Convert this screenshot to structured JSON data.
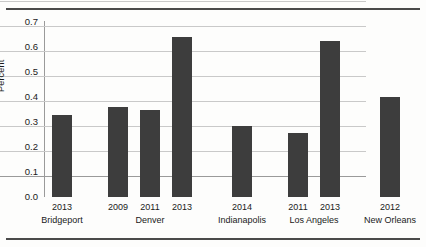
{
  "chart_data": {
    "type": "bar",
    "title": "",
    "xlabel": "",
    "ylabel": "Percent",
    "ylim": [
      0.0,
      0.75
    ],
    "yticks": [
      "0.0",
      "0.1",
      "0.2",
      "0.3",
      "0.4",
      "0.5",
      "0.6",
      "0.7"
    ],
    "ytick_values": [
      0.0,
      0.1,
      0.2,
      0.3,
      0.4,
      0.5,
      0.6,
      0.7
    ],
    "grid": "horizontal",
    "legend": "none",
    "categories": [
      "2013",
      "2009",
      "2011",
      "2013",
      "2014",
      "2011",
      "2013",
      "2012"
    ],
    "groups": [
      {
        "name": "Bridgeport",
        "years": [
          "2013"
        ]
      },
      {
        "name": "Denver",
        "years": [
          "2009",
          "2011",
          "2013"
        ]
      },
      {
        "name": "Indianapolis",
        "years": [
          "2014"
        ]
      },
      {
        "name": "Los Angeles",
        "years": [
          "2011",
          "2013"
        ]
      },
      {
        "name": "New Orleans",
        "years": [
          "2012"
        ]
      }
    ],
    "values": [
      0.33,
      0.36,
      0.35,
      0.64,
      0.285,
      0.255,
      0.625,
      0.4
    ],
    "bar_color": "#3d3d3d",
    "bars": [
      {
        "city": "Bridgeport",
        "year": "2013",
        "value": 0.33
      },
      {
        "city": "Denver",
        "year": "2009",
        "value": 0.36
      },
      {
        "city": "Denver",
        "year": "2011",
        "value": 0.35
      },
      {
        "city": "Denver",
        "year": "2013",
        "value": 0.64
      },
      {
        "city": "Indianapolis",
        "year": "2014",
        "value": 0.285
      },
      {
        "city": "Los Angeles",
        "year": "2011",
        "value": 0.255
      },
      {
        "city": "Los Angeles",
        "year": "2013",
        "value": 0.625
      },
      {
        "city": "New Orleans",
        "year": "2012",
        "value": 0.4
      }
    ]
  },
  "axis": {
    "y_title": "Percent",
    "y_tick_0": "0.0",
    "y_tick_1": "0.1",
    "y_tick_2": "0.2",
    "y_tick_3": "0.3",
    "y_tick_4": "0.4",
    "y_tick_5": "0.5",
    "y_tick_6": "0.6",
    "y_tick_7": "0.7"
  },
  "x_axis": {
    "years": [
      "2013",
      "2009",
      "2011",
      "2013",
      "2014",
      "2011",
      "2013",
      "2012"
    ],
    "group_labels": [
      "Bridgeport",
      "Denver",
      "Indianapolis",
      "Los Angeles",
      "New Orleans"
    ]
  },
  "colors": {
    "bar": "#3d3d3d",
    "grid": "#c9c9c9",
    "axis": "#9a9a9a",
    "rule": "#4a4a4a",
    "background": "#fdfdfc",
    "text": "#1a1a1a"
  }
}
